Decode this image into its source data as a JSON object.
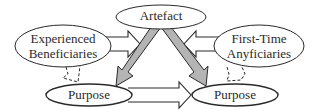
{
  "diagram": {
    "nodes": {
      "artefact": {
        "label": "Artefact"
      },
      "experienced": {
        "line1": "Experienced",
        "line2": "Beneficiaries"
      },
      "first_time": {
        "line1": "First-Time",
        "line2": "Anyficiaries"
      },
      "purpose_left": {
        "label": "Purpose"
      },
      "purpose_right": {
        "label": "Purpose"
      }
    },
    "edges": [
      {
        "from": "experienced",
        "to": "artefact",
        "style": "hollow-block-arrow"
      },
      {
        "from": "first_time",
        "to": "artefact",
        "style": "hollow-block-arrow"
      },
      {
        "from": "artefact",
        "to": "purpose_left",
        "style": "gray-block-arrow"
      },
      {
        "from": "artefact",
        "to": "purpose_right",
        "style": "gray-block-arrow"
      },
      {
        "from": "purpose_left",
        "to": "purpose_right",
        "style": "hollow-block-arrow"
      },
      {
        "from": "experienced",
        "to": "purpose_left",
        "style": "dashed-link"
      },
      {
        "from": "first_time",
        "to": "purpose_right",
        "style": "dashed-link"
      }
    ],
    "colors": {
      "stroke": "#2a2a2a",
      "gray_arrow_fill": "#b4b4b4",
      "background": "#ffffff"
    }
  }
}
